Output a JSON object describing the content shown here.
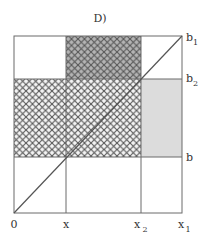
{
  "figure": {
    "title": "D)",
    "colors": {
      "line": "#6b6b6b",
      "hatch": "#555555",
      "hatch_dark_fill": "#b4b4b4",
      "hatch_light_fill": "#f4f4f4",
      "gray_fill": "#dcdcdc",
      "background": "#ffffff"
    },
    "x_axis_labels": {
      "origin": "0",
      "x": "x",
      "x2": {
        "base": "x",
        "sub": "2"
      },
      "x1": {
        "base": "x",
        "sub": "1"
      }
    },
    "y_axis_labels": {
      "b1": {
        "base": "b",
        "sub": "1"
      },
      "b2": {
        "base": "b",
        "sub": "2"
      },
      "b": "b"
    },
    "regions": [
      {
        "name": "top-middle",
        "fill": "dark crosshatch",
        "x": [
          "x",
          "x2"
        ],
        "y": [
          "b2",
          "b1"
        ]
      },
      {
        "name": "middle-band",
        "fill": "crosshatch",
        "x": [
          "0",
          "x2"
        ],
        "y": [
          "b",
          "b2"
        ]
      },
      {
        "name": "right-middle",
        "fill": "gray",
        "x": [
          "x2",
          "x1"
        ],
        "y": [
          "b",
          "b2"
        ]
      }
    ],
    "diagonal": {
      "from": "(0,0)",
      "to": "(x1,b1)"
    }
  }
}
